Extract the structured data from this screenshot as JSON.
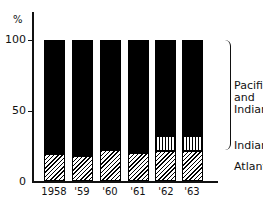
{
  "chart_data": {
    "type": "bar",
    "stacked": true,
    "title": "",
    "xlabel": "",
    "ylabel": "%",
    "ylim": [
      0,
      100
    ],
    "yticks": [
      "0",
      "50",
      "100"
    ],
    "categories": [
      "1958",
      "'59",
      "'60",
      "'61",
      "'62",
      "'63"
    ],
    "series": [
      {
        "name": "Atlantic",
        "pattern": "diagonal-hatch",
        "values": [
          19,
          18,
          22,
          20,
          21,
          21
        ]
      },
      {
        "name": "Indian",
        "pattern": "vertical-hatch",
        "values": [
          0,
          0,
          0,
          0,
          11,
          11
        ]
      },
      {
        "name": "Pacific and Indian",
        "pattern": "solid-black",
        "values": [
          81,
          82,
          78,
          80,
          68,
          68
        ]
      }
    ],
    "legend": [
      "Pacific and Indian",
      "Indian",
      "Atlantic"
    ],
    "legend_position": "right",
    "grid": false
  },
  "axis": {
    "unit": "%",
    "tick_0": "0",
    "tick_50": "50",
    "tick_100": "100"
  },
  "labels": {
    "l0": "1958",
    "l1": "'59",
    "l2": "'60",
    "l3": "'61",
    "l4": "'62",
    "l5": "'63"
  },
  "legend": {
    "pacific_line1": "Pacific",
    "pacific_line2": "and",
    "pacific_line3": "Indian",
    "indian": "Indian",
    "atlantic": "Atlantic"
  }
}
